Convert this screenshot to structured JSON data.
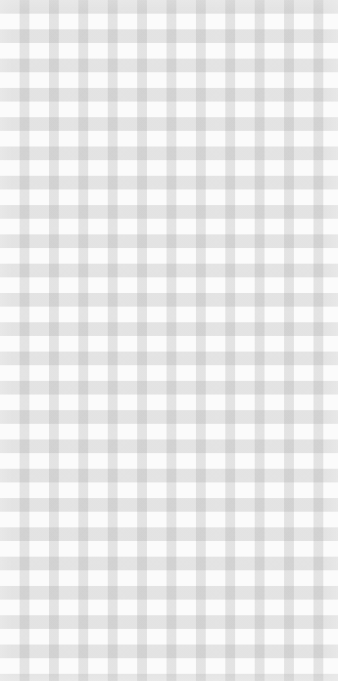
{
  "image": {
    "kind": "texture",
    "pattern": "gingham-check",
    "width": 338,
    "height": 681,
    "colors": {
      "background": "#fbfbfb",
      "stripe": "#e2e2e2",
      "intersection": "#c9c9c9"
    },
    "period_px": {
      "x": 29.4,
      "y": 29.3
    },
    "stripe_width_px": {
      "vertical": 15,
      "horizontal": 14
    },
    "text": []
  }
}
